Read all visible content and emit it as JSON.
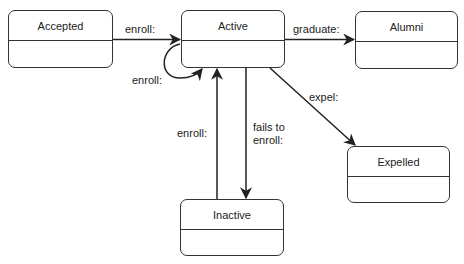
{
  "diagram": {
    "type": "state-machine",
    "states": [
      {
        "id": "accepted",
        "label": "Accepted"
      },
      {
        "id": "active",
        "label": "Active"
      },
      {
        "id": "alumni",
        "label": "Alumni"
      },
      {
        "id": "expelled",
        "label": "Expelled"
      },
      {
        "id": "inactive",
        "label": "Inactive"
      }
    ],
    "transitions": [
      {
        "from": "accepted",
        "to": "active",
        "label": "enroll:"
      },
      {
        "from": "active",
        "to": "active",
        "label": "enroll:"
      },
      {
        "from": "active",
        "to": "alumni",
        "label": "graduate:"
      },
      {
        "from": "active",
        "to": "expelled",
        "label": "expel:"
      },
      {
        "from": "active",
        "to": "inactive",
        "label_line1": "fails to",
        "label_line2": "enroll:"
      },
      {
        "from": "inactive",
        "to": "active",
        "label": "enroll:"
      }
    ]
  }
}
